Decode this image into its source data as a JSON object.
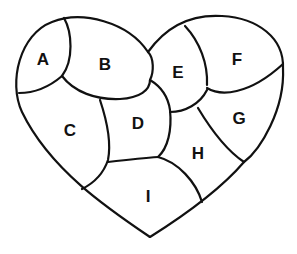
{
  "diagram": {
    "title": "",
    "shape": "heart",
    "stroke_color": "#111111",
    "background_color": "#ffffff",
    "regions": [
      {
        "id": "A",
        "label": "A",
        "x": 43,
        "y": 59
      },
      {
        "id": "B",
        "label": "B",
        "x": 105,
        "y": 64
      },
      {
        "id": "C",
        "label": "C",
        "x": 70,
        "y": 130
      },
      {
        "id": "D",
        "label": "D",
        "x": 138,
        "y": 123
      },
      {
        "id": "E",
        "label": "E",
        "x": 178,
        "y": 72
      },
      {
        "id": "F",
        "label": "F",
        "x": 237,
        "y": 59
      },
      {
        "id": "G",
        "label": "G",
        "x": 239,
        "y": 118
      },
      {
        "id": "H",
        "label": "H",
        "x": 198,
        "y": 153
      },
      {
        "id": "I",
        "label": "I",
        "x": 148,
        "y": 196
      }
    ]
  }
}
